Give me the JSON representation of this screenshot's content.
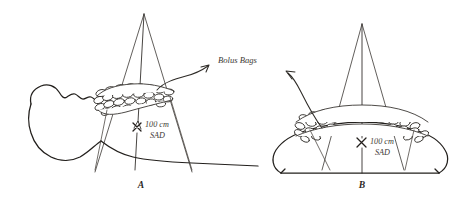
{
  "figure": {
    "background_color": "#ffffff",
    "ink_color": "#2a2724",
    "text_color": "#3d3934",
    "callout_label": "Bolus Bags",
    "panels": [
      {
        "id": "A",
        "panel_label": "A",
        "view": "lateral head and neck profile",
        "sad_line_1": "100 cm",
        "sad_line_2": "SAD",
        "sad_value": "100 cm",
        "sad_abbreviation": "SAD",
        "beam_apex": {
          "x": 144,
          "y": 14
        },
        "isocenter": {
          "x": 136,
          "y": 127
        },
        "bolus_bag_count": 26
      },
      {
        "id": "B",
        "panel_label": "B",
        "view": "cross section on treatment couch",
        "sad_line_1": "100 cm",
        "sad_line_2": "SAD",
        "sad_value": "100 cm",
        "sad_abbreviation": "SAD",
        "beam_apex": {
          "x": 362,
          "y": 24
        },
        "isocenter": {
          "x": 362,
          "y": 143
        },
        "bolus_bag_count": 34
      }
    ]
  }
}
